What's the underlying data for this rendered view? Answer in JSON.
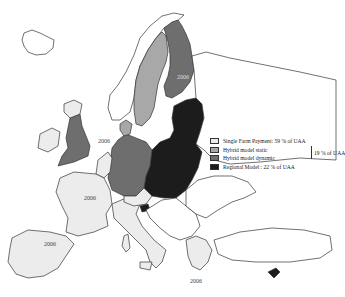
{
  "map": {
    "region": "Europe (EU member states)",
    "colors": {
      "single_farm_payment": "#ececec",
      "hybrid_static": "#a8a8a8",
      "hybrid_dynamic": "#6e6e6e",
      "regional": "#1c1c1c",
      "non_member": "#ffffff",
      "outline": "#333333"
    },
    "year_labels": [
      {
        "country": "Finland",
        "text": "2006"
      },
      {
        "country": "Denmark/Germany coast",
        "text": "2006"
      },
      {
        "country": "France",
        "text": "2006"
      },
      {
        "country": "Spain",
        "text": "2006"
      },
      {
        "country": "Greece",
        "text": "2006"
      }
    ]
  },
  "legend": {
    "items": [
      {
        "label": "Single Farm Payment: 59 % of UAA",
        "color": "#ececec"
      },
      {
        "label": "Hybrid model static",
        "color": "#a8a8a8"
      },
      {
        "label": "Hybrid model dynamic",
        "color": "#6e6e6e"
      },
      {
        "label": "Regional Model : 22 % of UAA",
        "color": "#1c1c1c"
      }
    ],
    "hybrid_group_label": "19 % of UAA"
  }
}
